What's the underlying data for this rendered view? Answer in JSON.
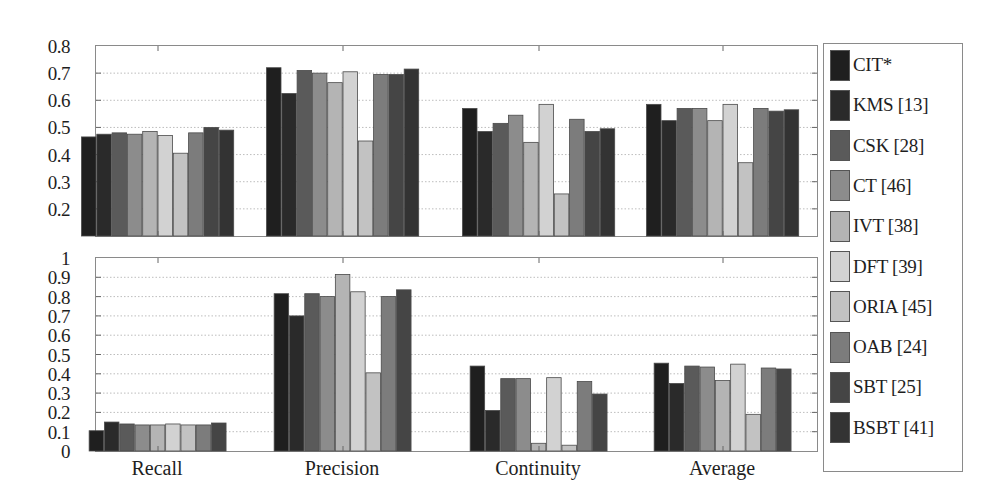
{
  "chart_data": [
    {
      "type": "bar",
      "panel": "top",
      "title": "",
      "xlabel": "",
      "ylabel": "",
      "ylim": [
        0.1,
        0.8
      ],
      "yticks": [
        "0.8",
        "0.7",
        "0.6",
        "0.5",
        "0.4",
        "0.3",
        "0.2"
      ],
      "grid": true,
      "categories": [
        "Recall",
        "Precision",
        "Continuity",
        "Average"
      ],
      "series": [
        {
          "name": "CIT*",
          "color": "#1f1f1f",
          "values": [
            0.465,
            0.72,
            0.57,
            0.585
          ]
        },
        {
          "name": "KMS [13]",
          "color": "#2a2a2a",
          "values": [
            0.475,
            0.625,
            0.485,
            0.525
          ]
        },
        {
          "name": "CSK [28]",
          "color": "#5a5a5a",
          "values": [
            0.48,
            0.71,
            0.515,
            0.57
          ]
        },
        {
          "name": "CT [46]",
          "color": "#8c8c8c",
          "values": [
            0.475,
            0.7,
            0.545,
            0.57
          ]
        },
        {
          "name": "IVT [38]",
          "color": "#b4b4b4",
          "values": [
            0.485,
            0.665,
            0.445,
            0.525
          ]
        },
        {
          "name": "DFT [39]",
          "color": "#d2d2d2",
          "values": [
            0.47,
            0.705,
            0.585,
            0.585
          ]
        },
        {
          "name": "ORIA [45]",
          "color": "#c2c2c2",
          "values": [
            0.405,
            0.45,
            0.255,
            0.37
          ]
        },
        {
          "name": "OAB [24]",
          "color": "#7c7c7c",
          "values": [
            0.48,
            0.695,
            0.53,
            0.57
          ]
        },
        {
          "name": "SBT [25]",
          "color": "#454545",
          "values": [
            0.5,
            0.695,
            0.485,
            0.56
          ]
        },
        {
          "name": "BSBT [41]",
          "color": "#333333",
          "values": [
            0.49,
            0.715,
            0.495,
            0.565
          ]
        }
      ]
    },
    {
      "type": "bar",
      "panel": "bottom",
      "title": "",
      "xlabel": "",
      "ylabel": "",
      "ylim": [
        0,
        1
      ],
      "yticks": [
        "1",
        "0.9",
        "0.8",
        "0.7",
        "0.6",
        "0.5",
        "0.4",
        "0.3",
        "0.2",
        "0.1",
        "0"
      ],
      "grid": true,
      "categories": [
        "Recall",
        "Precision",
        "Continuity",
        "Average"
      ],
      "series": [
        {
          "name": "CIT*",
          "color": "#1f1f1f",
          "values": [
            0.105,
            0.815,
            0.44,
            0.455
          ]
        },
        {
          "name": "KMS [13]",
          "color": "#2a2a2a",
          "values": [
            0.15,
            0.7,
            0.21,
            0.35
          ]
        },
        {
          "name": "CSK [28]",
          "color": "#5a5a5a",
          "values": [
            0.14,
            0.815,
            0.375,
            0.44
          ]
        },
        {
          "name": "CT [46]",
          "color": "#8c8c8c",
          "values": [
            0.135,
            0.8,
            0.375,
            0.435
          ]
        },
        {
          "name": "IVT [38]",
          "color": "#b4b4b4",
          "values": [
            0.135,
            0.915,
            0.04,
            0.365
          ]
        },
        {
          "name": "DFT [39]",
          "color": "#d2d2d2",
          "values": [
            0.14,
            0.825,
            0.38,
            0.45
          ]
        },
        {
          "name": "ORIA [45]",
          "color": "#c2c2c2",
          "values": [
            0.135,
            0.405,
            0.03,
            0.19
          ]
        },
        {
          "name": "OAB [24]",
          "color": "#7c7c7c",
          "values": [
            0.135,
            0.8,
            0.36,
            0.43
          ]
        },
        {
          "name": "SBT [25]",
          "color": "#454545",
          "values": [
            0.145,
            0.835,
            0.295,
            0.425
          ]
        }
      ]
    }
  ],
  "legend": {
    "position": "right",
    "items": [
      {
        "label": "CIT*",
        "color": "#1f1f1f"
      },
      {
        "label": "KMS [13]",
        "color": "#2a2a2a"
      },
      {
        "label": "CSK [28]",
        "color": "#5a5a5a"
      },
      {
        "label": "CT [46]",
        "color": "#8c8c8c"
      },
      {
        "label": "IVT [38]",
        "color": "#b4b4b4"
      },
      {
        "label": "DFT [39]",
        "color": "#d2d2d2"
      },
      {
        "label": "ORIA [45]",
        "color": "#c2c2c2"
      },
      {
        "label": "OAB [24]",
        "color": "#7c7c7c"
      },
      {
        "label": "SBT [25]",
        "color": "#454545"
      },
      {
        "label": "BSBT [41]",
        "color": "#333333"
      }
    ]
  },
  "x_labels": [
    "Recall",
    "Precision",
    "Continuity",
    "Average"
  ]
}
